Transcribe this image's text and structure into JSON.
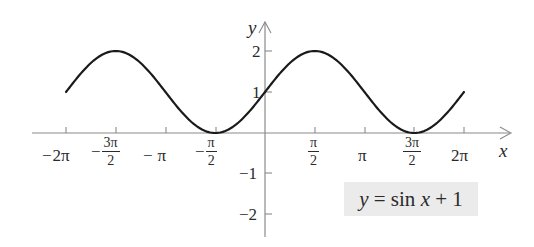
{
  "chart_data": {
    "type": "line",
    "title": "",
    "function": "y = sin x + 1",
    "xlabel": "x",
    "ylabel": "y",
    "xlim": [
      -6.2832,
      6.2832
    ],
    "ylim": [
      -2,
      2
    ],
    "grid": false,
    "x_ticks": [
      {
        "value": -6.2832,
        "label": "−2π"
      },
      {
        "value": -4.7124,
        "label": "−3π/2"
      },
      {
        "value": -3.1416,
        "label": "−π"
      },
      {
        "value": -1.5708,
        "label": "−π/2"
      },
      {
        "value": 1.5708,
        "label": "π/2"
      },
      {
        "value": 3.1416,
        "label": "π"
      },
      {
        "value": 4.7124,
        "label": "3π/2"
      },
      {
        "value": 6.2832,
        "label": "2π"
      }
    ],
    "y_ticks": [
      {
        "value": 2,
        "label": "2"
      },
      {
        "value": 1,
        "label": "1"
      },
      {
        "value": -1,
        "label": "−1"
      },
      {
        "value": -2,
        "label": "−2"
      }
    ],
    "series": [
      {
        "name": "y = sin x + 1",
        "x": [
          -6.2832,
          -4.7124,
          -3.1416,
          -1.5708,
          0,
          1.5708,
          3.1416,
          4.7124,
          6.2832
        ],
        "values": [
          1,
          2,
          1,
          0,
          1,
          2,
          1,
          0,
          1
        ]
      }
    ],
    "annotations": [
      {
        "text": "y = sin x + 1",
        "position": "lower-right",
        "boxed": true
      }
    ],
    "colors": {
      "curve": "#1a1a1a",
      "axis": "#8a8a8a",
      "label_box": "#ebebeb"
    }
  },
  "labels": {
    "x_axis": "x",
    "y_axis": "y",
    "x_ticks": {
      "neg2pi": {
        "sign": "−",
        "text": "2π"
      },
      "neg3pi2": {
        "sign": "−",
        "num": "3π",
        "den": "2"
      },
      "negpi": {
        "sign": "−",
        "text": "π"
      },
      "negpi2": {
        "sign": "−",
        "num": "π",
        "den": "2"
      },
      "pi2": {
        "num": "π",
        "den": "2"
      },
      "pi": {
        "text": "π"
      },
      "threepi2": {
        "num": "3π",
        "den": "2"
      },
      "twopi": {
        "text": "2π"
      }
    },
    "y_ticks": {
      "two": "2",
      "one": "1",
      "neg1": "−1",
      "neg2": "−2"
    }
  },
  "equation": {
    "y": "y",
    "eq": " = sin ",
    "x": "x",
    "rest": " + 1"
  }
}
